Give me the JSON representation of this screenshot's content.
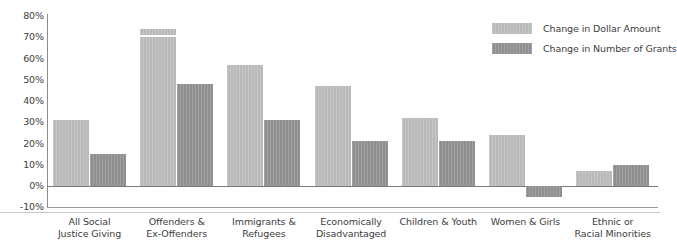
{
  "chart_data": {
    "type": "bar",
    "title": "",
    "subtitle": "",
    "xlabel": "",
    "ylabel": "",
    "ylim": [
      -10,
      80
    ],
    "ytick_labels": [
      "80%",
      "70%",
      "60%",
      "50%",
      "40%",
      "30%",
      "20%",
      "10%",
      "0%",
      "-10%"
    ],
    "ytick_values": [
      80,
      70,
      60,
      50,
      40,
      30,
      20,
      10,
      0,
      -10
    ],
    "grid": false,
    "legend_position": "top-right",
    "categories": [
      "All Social\nJustice Giving",
      "Offenders &\nEx-Offenders",
      "Immigrants &\nRefugees",
      "Economically\nDisadvantaged",
      "Children & Youth",
      "Women & Girls",
      "Ethnic or\nRacial Minorities"
    ],
    "category_lines": [
      [
        "All Social",
        "Justice Giving"
      ],
      [
        "Offenders &",
        "Ex-Offenders"
      ],
      [
        "Immigrants &",
        "Refugees"
      ],
      [
        "Economically",
        "Disadvantaged"
      ],
      [
        "Children & Youth",
        ""
      ],
      [
        "Women & Girls",
        ""
      ],
      [
        "Ethnic or",
        "Racial Minorities"
      ]
    ],
    "series": [
      {
        "name": "Change in Dollar Amount",
        "color": "#b9b9b9",
        "values": [
          31,
          74,
          57,
          47,
          32,
          24,
          7
        ]
      },
      {
        "name": "Change in Number of Grants",
        "color": "#8f8f8f",
        "values": [
          15,
          48,
          31,
          21,
          21,
          -5,
          10
        ]
      }
    ]
  },
  "legend": {
    "items": [
      {
        "label": "Change in Dollar Amount",
        "color": "#b9b9b9"
      },
      {
        "label": "Change in Number of Grants",
        "color": "#8f8f8f"
      }
    ]
  },
  "axis": {
    "zero_label": "0%",
    "top_label": "80%",
    "bottom_label": "-10%"
  },
  "colors": {
    "light_bar": "#b9b9b9",
    "dark_bar": "#8f8f8f",
    "axis": "#8e8e8e",
    "zero_line": "#7b7b7b",
    "text": "#3d3d3d",
    "background": "#ffffff"
  }
}
